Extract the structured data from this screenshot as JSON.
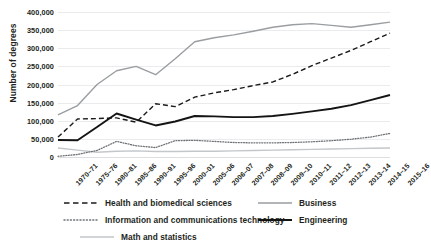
{
  "chart_data": {
    "type": "line",
    "title": "",
    "xlabel": "",
    "ylabel": "Number of degrees",
    "ylim": [
      0,
      400000
    ],
    "ytick_labels": [
      "400,000",
      "350,000",
      "300,000",
      "250,000",
      "200,000",
      "150,000",
      "100,000",
      "50,000",
      "0"
    ],
    "ytick_values": [
      400000,
      350000,
      300000,
      250000,
      200000,
      150000,
      100000,
      50000,
      0
    ],
    "grid": true,
    "legend_position": "bottom",
    "categories": [
      "1970–71",
      "1975–76",
      "1980–81",
      "1985–86",
      "1990–91",
      "1995–96",
      "2000–01",
      "2005–06",
      "2006–07",
      "2007–08",
      "2008–09",
      "2009–10",
      "2010–11",
      "2011–12",
      "2012–13",
      "2013–14",
      "2014–15",
      "2015–16"
    ],
    "series": [
      {
        "name": "Health and biomedical sciences",
        "style": "dashed",
        "color": "#1a1a1a",
        "values": [
          55000,
          105000,
          106000,
          108000,
          96000,
          147000,
          139000,
          165000,
          177000,
          186000,
          197000,
          207000,
          228000,
          252000,
          273000,
          294000,
          318000,
          342000
        ]
      },
      {
        "name": "Information and communications technology",
        "style": "dotted",
        "color": "#6f7376",
        "values": [
          2000,
          7000,
          18000,
          43000,
          31000,
          26000,
          45000,
          46000,
          43000,
          40000,
          39000,
          39000,
          40000,
          42000,
          45000,
          49000,
          55000,
          65000
        ]
      },
      {
        "name": "Math and statistics",
        "style": "solid",
        "color": "#c3c7ca",
        "values": [
          25000,
          19000,
          13000,
          16000,
          17000,
          15000,
          15000,
          16000,
          16000,
          17000,
          18000,
          19000,
          20000,
          21000,
          22000,
          23000,
          24000,
          25000
        ]
      },
      {
        "name": "Business",
        "style": "solid",
        "color": "#9a9ea1",
        "values": [
          116000,
          142000,
          200000,
          238000,
          250000,
          227000,
          271000,
          318000,
          329000,
          337000,
          347000,
          358000,
          365000,
          368000,
          363000,
          358000,
          365000,
          372000
        ]
      },
      {
        "name": "Engineering",
        "style": "solid",
        "color": "#141414",
        "values": [
          47000,
          46000,
          83000,
          120000,
          103000,
          87000,
          98000,
          113000,
          112000,
          110000,
          110000,
          113000,
          119000,
          126000,
          133000,
          143000,
          157000,
          171000
        ]
      }
    ]
  },
  "legend": {
    "items": [
      {
        "label": "Health and biomedical sciences",
        "icon": "dashed-line-icon"
      },
      {
        "label": "Information and communications technology",
        "icon": "dotted-line-icon"
      },
      {
        "label": "Math and statistics",
        "icon": "solid-line-icon"
      },
      {
        "label": "Business",
        "icon": "solid-line-icon"
      },
      {
        "label": "Engineering",
        "icon": "solid-line-icon"
      }
    ]
  }
}
